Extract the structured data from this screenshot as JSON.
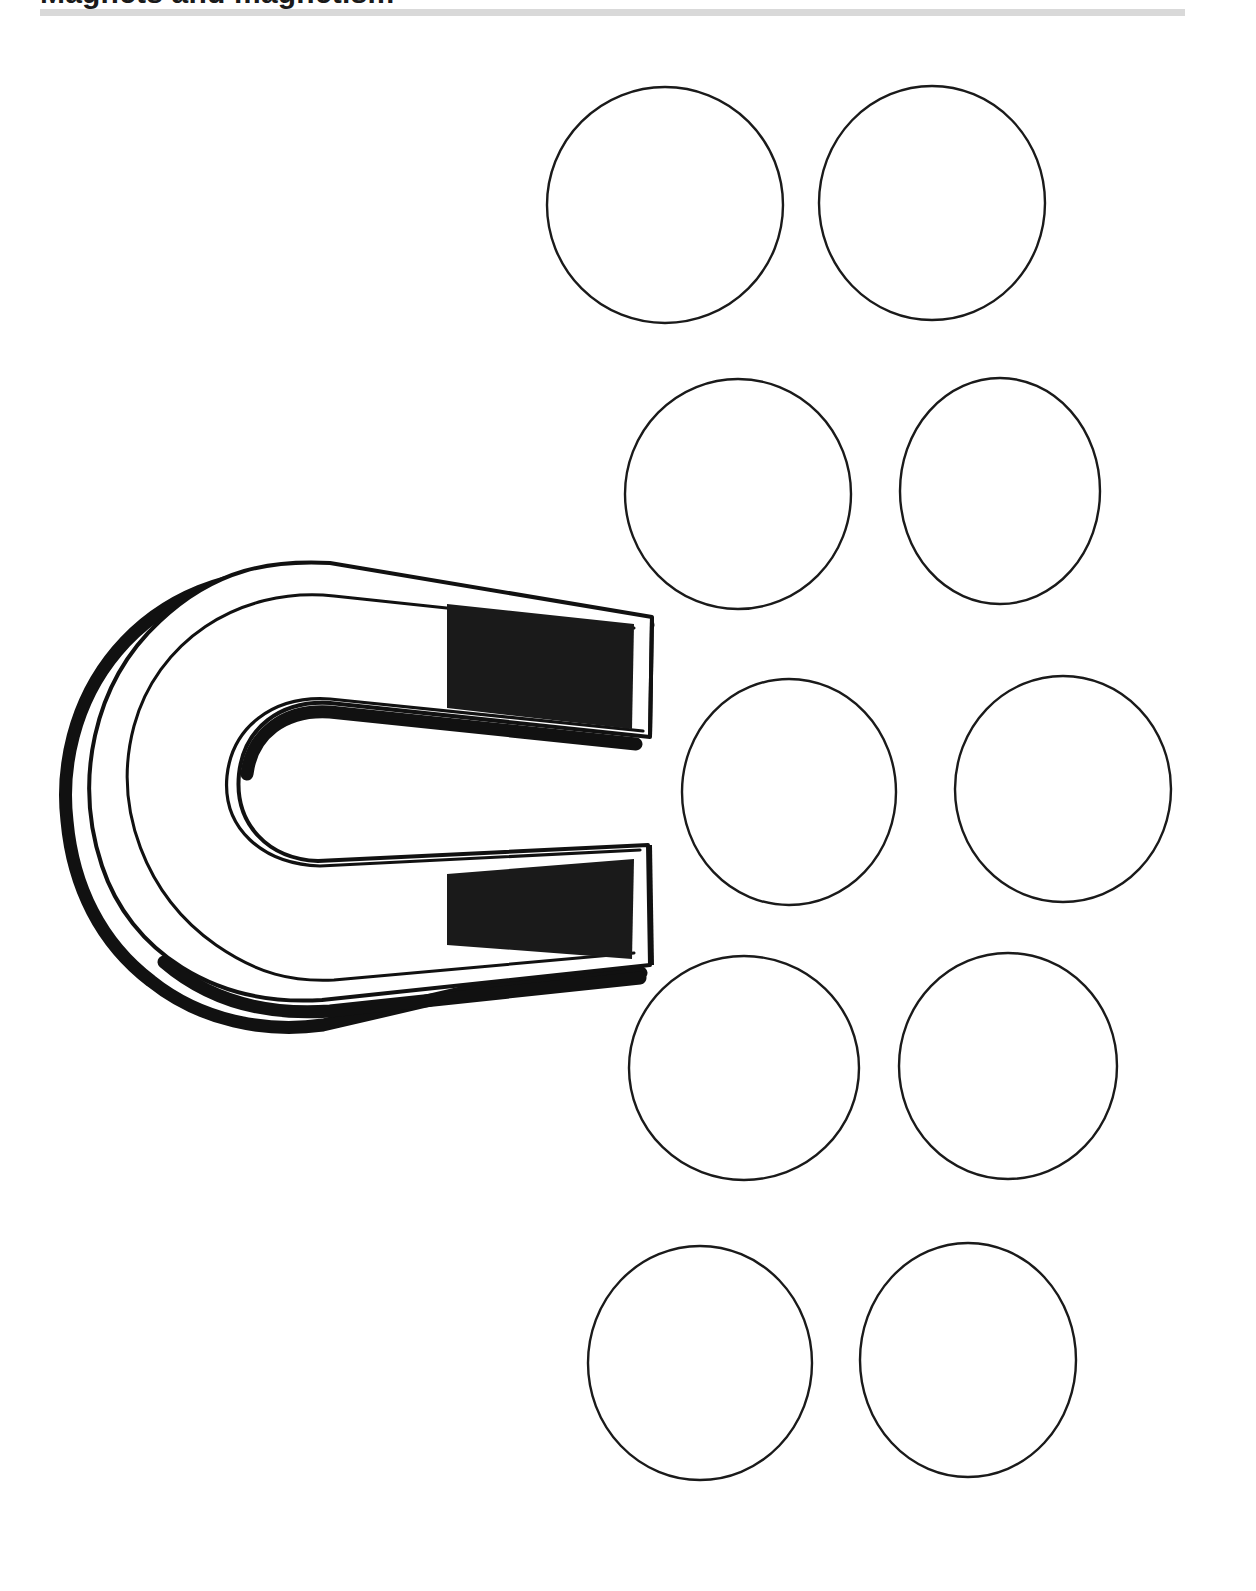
{
  "page": {
    "width": 1256,
    "height": 1591,
    "background_color": "#ffffff",
    "document_kind": "worksheet-page"
  },
  "header": {
    "title": "Magnets and magnetism",
    "title_visible_fragment": "partially cropped — only the bottoms of the letters are visible",
    "rule": {
      "name": "header-rule",
      "color": "#d9d9d9",
      "x": 40,
      "y": 9,
      "width": 1145,
      "height": 7
    }
  },
  "illustration": {
    "name": "horseshoe-magnet",
    "description": "Line-art U-shaped horseshoe magnet opening toward the right with solid black pole tips and a heavy drop-shadow outline",
    "outline_color": "#111111",
    "fill_color": "#ffffff",
    "pole_fill_color": "#1a1a1a",
    "shadow_color": "#111111",
    "bounds": {
      "x": 70,
      "y": 558,
      "width": 585,
      "height": 460
    }
  },
  "circles": {
    "count": 10,
    "stroke_color": "#1a1a1a",
    "fill_color": "#ffffff",
    "stroke_width": 2.4,
    "items": [
      {
        "id": 1,
        "row": 1,
        "column": 1,
        "cx": 665,
        "cy": 205,
        "rx": 118,
        "ry": 118
      },
      {
        "id": 2,
        "row": 1,
        "column": 2,
        "cx": 932,
        "cy": 203,
        "rx": 113,
        "ry": 117
      },
      {
        "id": 3,
        "row": 2,
        "column": 1,
        "cx": 738,
        "cy": 494,
        "rx": 113,
        "ry": 115
      },
      {
        "id": 4,
        "row": 2,
        "column": 2,
        "cx": 1000,
        "cy": 491,
        "rx": 100,
        "ry": 113
      },
      {
        "id": 5,
        "row": 3,
        "column": 1,
        "cx": 789,
        "cy": 792,
        "rx": 107,
        "ry": 113
      },
      {
        "id": 6,
        "row": 3,
        "column": 2,
        "cx": 1063,
        "cy": 789,
        "rx": 108,
        "ry": 113
      },
      {
        "id": 7,
        "row": 4,
        "column": 1,
        "cx": 744,
        "cy": 1068,
        "rx": 115,
        "ry": 112
      },
      {
        "id": 8,
        "row": 4,
        "column": 2,
        "cx": 1008,
        "cy": 1066,
        "rx": 109,
        "ry": 113
      },
      {
        "id": 9,
        "row": 5,
        "column": 1,
        "cx": 700,
        "cy": 1363,
        "rx": 112,
        "ry": 117
      },
      {
        "id": 10,
        "row": 5,
        "column": 2,
        "cx": 968,
        "cy": 1360,
        "rx": 108,
        "ry": 117
      }
    ]
  }
}
